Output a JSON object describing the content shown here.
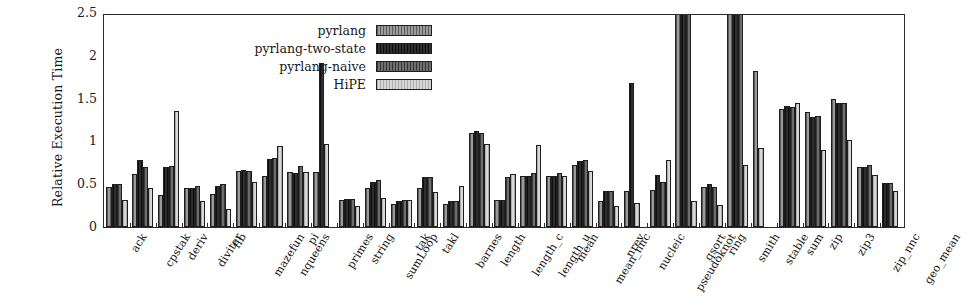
{
  "chart_data": {
    "type": "bar",
    "title": "",
    "xlabel": "",
    "ylabel": "Relative Execution Time",
    "ylim": [
      0,
      2.5
    ],
    "yticks": [
      "0",
      "0.5",
      "1",
      "1.5",
      "2",
      "2.5"
    ],
    "ytick_values": [
      0,
      0.5,
      1,
      1.5,
      2,
      2.5
    ],
    "grid": false,
    "legend_position": "top-left-inside",
    "clipped_note": "Bars exceeding 2.5 are clipped at the top axis (qsort and smith, series pyrlang-two-state / pyrlang-naive)",
    "categories": [
      "ack",
      "cpstak",
      "deriv",
      "diviter",
      "fib",
      "mazefun",
      "nqueens",
      "pi",
      "primes",
      "string",
      "sumLoop",
      "tak",
      "takl",
      "barnes",
      "length",
      "length_c",
      "length_u",
      "mean",
      "mean_nnc",
      "nrev",
      "nucleic",
      "pseudoknot",
      "qsort",
      "ring",
      "smith",
      "stable",
      "sum",
      "zip",
      "zip3",
      "zip_nnc",
      "geo_mean"
    ],
    "series": [
      {
        "name": "pyrlang",
        "color": "#9a9a9a",
        "values": [
          0.47,
          0.62,
          0.37,
          0.45,
          0.38,
          0.65,
          0.6,
          0.64,
          0.64,
          0.32,
          0.45,
          0.27,
          0.45,
          0.27,
          1.1,
          0.31,
          0.6,
          0.6,
          0.73,
          0.3,
          0.42,
          0.43,
          2.5,
          0.47,
          2.5,
          1.82,
          1.38,
          1.34,
          1.5,
          0.7,
          null
        ]
      },
      {
        "name": "pyrlang-two-state",
        "color": "#2e2e2e",
        "values": [
          0.5,
          0.78,
          0.7,
          0.45,
          0.48,
          0.67,
          0.8,
          0.63,
          1.92,
          0.33,
          0.53,
          0.3,
          0.58,
          0.3,
          1.12,
          0.31,
          0.6,
          0.6,
          0.77,
          0.42,
          1.68,
          0.61,
          2.5,
          0.5,
          2.5,
          null,
          1.41,
          1.29,
          1.45,
          0.7,
          0.51
        ]
      },
      {
        "name": "pyrlang-naive",
        "color": "#6e6e6e",
        "values": [
          0.5,
          0.7,
          0.71,
          0.48,
          0.5,
          0.66,
          0.81,
          0.71,
          null,
          0.33,
          0.55,
          0.32,
          0.59,
          0.3,
          1.1,
          0.59,
          0.63,
          0.63,
          0.78,
          0.42,
          null,
          0.53,
          2.5,
          0.47,
          2.5,
          null,
          1.4,
          1.3,
          1.45,
          0.72,
          0.51
        ]
      },
      {
        "name": "HiPE",
        "color": "#d8d8d8",
        "values": [
          0.31,
          0.46,
          1.35,
          0.3,
          0.21,
          0.53,
          0.95,
          0.64,
          0.97,
          0.25,
          0.34,
          0.32,
          0.41,
          0.48,
          0.97,
          0.62,
          0.96,
          0.6,
          0.65,
          0.24,
          0.28,
          0.78,
          0.3,
          0.26,
          0.73,
          0.92,
          1.45,
          0.9,
          1.02,
          0.61,
          0.42
        ]
      }
    ]
  },
  "legend": {
    "entries": [
      {
        "label": "pyrlang",
        "swatch": "legend-swatch-pyrlang"
      },
      {
        "label": "pyrlang-two-state",
        "swatch": "legend-swatch-pyrlang-two-state"
      },
      {
        "label": "pyrlang-naive",
        "swatch": "legend-swatch-pyrlang-naive"
      },
      {
        "label": "HiPE",
        "swatch": "legend-swatch-hipe"
      }
    ]
  },
  "axes": {
    "y_title": "Relative Execution Time"
  }
}
